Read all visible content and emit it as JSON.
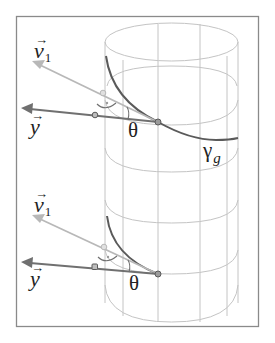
{
  "figure": {
    "colors": {
      "frame": "#8a8a8a",
      "cylinder_grid": "#c4c4c4",
      "curve": "#5a5a5a",
      "vector_y": "#707070",
      "vector_v1": "#b8b8b8",
      "point_fill": "#9a9a9a"
    }
  },
  "labels": {
    "top": {
      "v1_letter": "v",
      "v1_sub": "1",
      "v_arrow": "→",
      "y_letter": "y",
      "y_arrow": "→",
      "theta": "θ",
      "gamma": "γ",
      "gamma_sub": "g"
    },
    "bottom": {
      "v1_letter": "v",
      "v1_sub": "1",
      "v_arrow": "→",
      "y_letter": "y",
      "y_arrow": "→",
      "theta": "θ"
    }
  }
}
